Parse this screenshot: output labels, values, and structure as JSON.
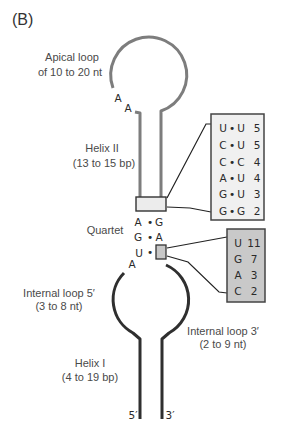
{
  "panel_label": "(B)",
  "apical_loop": {
    "label_line1": "Apical loop",
    "label_line2": "of 10 to 20 nt",
    "bases": [
      "A",
      "A"
    ]
  },
  "helix_ii": {
    "label_line1": "Helix II",
    "label_line2": "(13 to 15 bp)"
  },
  "helix_ii_terminal_pairs": {
    "rows": [
      {
        "left": "U",
        "sep": "•",
        "right": "U",
        "count": "5"
      },
      {
        "left": "C",
        "sep": "•",
        "right": "U",
        "count": "5"
      },
      {
        "left": "C",
        "sep": "•",
        "right": "C",
        "count": "4"
      },
      {
        "left": "A",
        "sep": "•",
        "right": "U",
        "count": "4"
      },
      {
        "left": "G",
        "sep": "•",
        "right": "U",
        "count": "3"
      },
      {
        "left": "G",
        "sep": "•",
        "right": "G",
        "count": "2"
      }
    ]
  },
  "quartet": {
    "label": "Quartet",
    "pairs": [
      {
        "left": "A",
        "sep": "•",
        "right": "G"
      },
      {
        "left": "G",
        "sep": "•",
        "right": "A"
      },
      {
        "left": "U",
        "sep": "•",
        "right": ""
      }
    ],
    "unpaired_base": "A"
  },
  "quartet_variable_position": {
    "rows": [
      {
        "base": "U",
        "count": "11"
      },
      {
        "base": "G",
        "count": "7"
      },
      {
        "base": "A",
        "count": "3"
      },
      {
        "base": "C",
        "count": "2"
      }
    ]
  },
  "internal_loop_5": {
    "label_line1": "Internal loop 5′",
    "label_line2": "(3 to 8 nt)"
  },
  "internal_loop_3": {
    "label_line1": "Internal loop 3′",
    "label_line2": "(2 to 9 nt)"
  },
  "helix_i": {
    "label_line1": "Helix I",
    "label_line2": "(4 to 19 bp)"
  },
  "ends": {
    "five_prime": "5′",
    "three_prime": "3′"
  },
  "colors": {
    "upper_strand": "#7d7d7d",
    "lower_strand": "#2f2f2f",
    "helix_ii_table_fill": "#f0f0f0",
    "quartet_table_fill": "#c9c9c9",
    "helix_ii_end_box_fill": "#ececec",
    "quartet_box_fill": "#c8c8c8"
  }
}
